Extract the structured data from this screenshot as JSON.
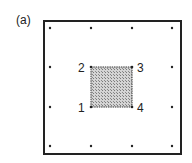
{
  "panel_label": "(a)",
  "grid_dots": [
    {
      "x": 50,
      "y": 28
    },
    {
      "x": 91,
      "y": 28
    },
    {
      "x": 132,
      "y": 28
    },
    {
      "x": 172,
      "y": 28
    },
    {
      "x": 50,
      "y": 67
    },
    {
      "x": 172,
      "y": 67
    },
    {
      "x": 50,
      "y": 107
    },
    {
      "x": 172,
      "y": 107
    },
    {
      "x": 50,
      "y": 146
    },
    {
      "x": 91,
      "y": 146
    },
    {
      "x": 132,
      "y": 146
    },
    {
      "x": 172,
      "y": 146
    }
  ],
  "element": {
    "fill_color": "#b8b8b8",
    "nodes": [
      {
        "id": "1",
        "label": "1",
        "x": 91,
        "y": 107
      },
      {
        "id": "2",
        "label": "2",
        "x": 91,
        "y": 67
      },
      {
        "id": "3",
        "label": "3",
        "x": 132,
        "y": 67
      },
      {
        "id": "4",
        "label": "4",
        "x": 132,
        "y": 107
      }
    ]
  },
  "colors": {
    "stroke": "#222222",
    "background": "#ffffff"
  }
}
